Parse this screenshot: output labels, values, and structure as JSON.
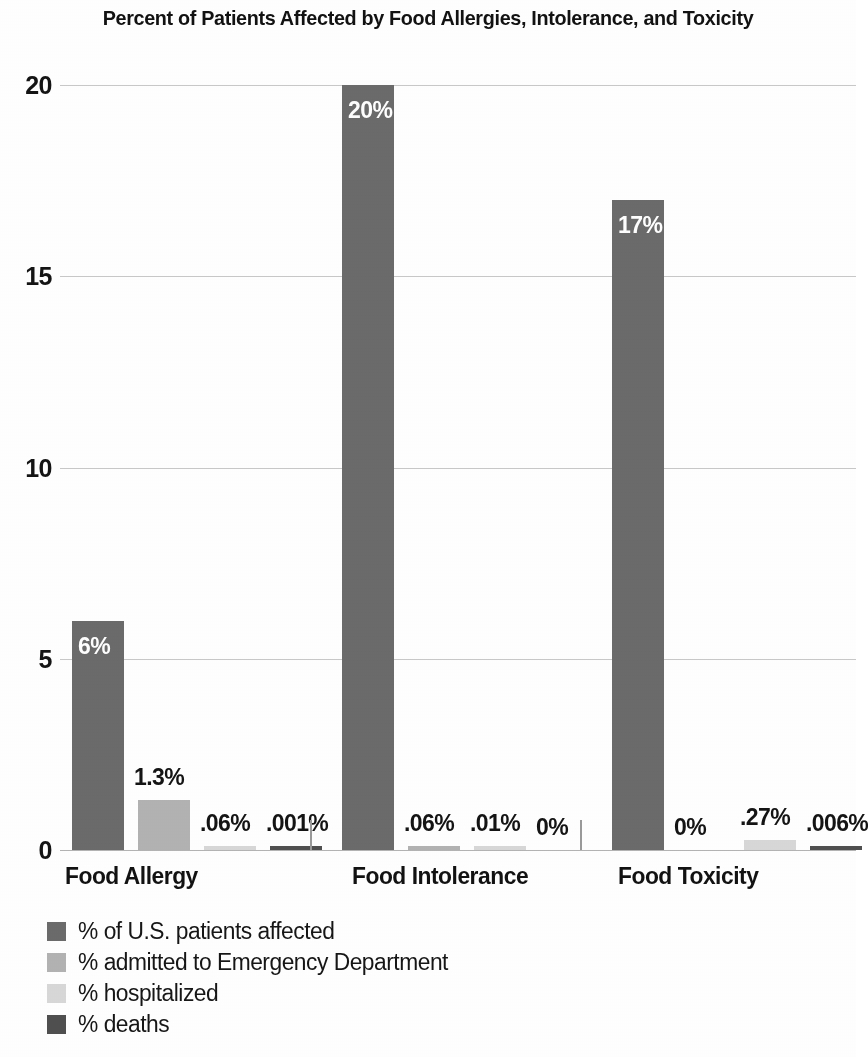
{
  "chart_data": {
    "type": "bar",
    "title": "Percent of Patients Affected by Food Allergies, Intolerance, and Toxicity",
    "xlabel": "",
    "ylabel": "",
    "ylim": [
      0,
      20
    ],
    "yticks": [
      0,
      5,
      10,
      15,
      20
    ],
    "ytick_labels": [
      "0",
      "5",
      "10",
      "15",
      "20"
    ],
    "grid": true,
    "legend_position": "bottom-left",
    "categories": [
      "Food Allergy",
      "Food Intolerance",
      "Food Toxicity"
    ],
    "series": [
      {
        "name": "% of U.S. patients affected",
        "color": "#6b6b6b",
        "values": [
          6,
          20,
          17
        ],
        "labels": [
          "6%",
          "20%",
          "17%"
        ]
      },
      {
        "name": "% admitted to Emergency Department",
        "color": "#b3b3b3",
        "values": [
          1.3,
          0.06,
          0
        ],
        "labels": [
          "1.3%",
          ".06%",
          "0%"
        ]
      },
      {
        "name": "% hospitalized",
        "color": "#d8d8d8",
        "values": [
          0.06,
          0.01,
          0.27
        ],
        "labels": [
          ".06%",
          ".01%",
          ".27%"
        ]
      },
      {
        "name": "% deaths",
        "color": "#4f4f4f",
        "values": [
          0.001,
          0,
          0.006
        ],
        "labels": [
          ".001%",
          "0%",
          ".006%"
        ]
      }
    ]
  },
  "axis": {
    "y_ticks": [
      {
        "value": "20"
      },
      {
        "value": "15"
      },
      {
        "value": "10"
      },
      {
        "value": "5"
      },
      {
        "value": "0"
      }
    ]
  },
  "categories": [
    {
      "label": "Food Allergy"
    },
    {
      "label": "Food Intolerance"
    },
    {
      "label": "Food Toxicity"
    }
  ],
  "legend": {
    "items": [
      {
        "label": "% of U.S. patients affected",
        "color": "#6b6b6b"
      },
      {
        "label": "% admitted to Emergency Department",
        "color": "#b3b3b3"
      },
      {
        "label": "% hospitalized",
        "color": "#d8d8d8"
      },
      {
        "label": "% deaths",
        "color": "#4f4f4f"
      }
    ]
  },
  "bar_labels": {
    "g0": [
      {
        "text": "6%",
        "inside": true
      },
      {
        "text": "1.3%",
        "inside": false
      },
      {
        "text": ".06%",
        "inside": false
      },
      {
        "text": ".001%",
        "inside": false
      }
    ],
    "g1": [
      {
        "text": "20%",
        "inside": true
      },
      {
        "text": ".06%",
        "inside": false
      },
      {
        "text": ".01%",
        "inside": false
      },
      {
        "text": "0%",
        "inside": false
      }
    ],
    "g2": [
      {
        "text": "17%",
        "inside": true
      },
      {
        "text": "0%",
        "inside": false
      },
      {
        "text": ".27%",
        "inside": false
      },
      {
        "text": ".006%",
        "inside": false
      }
    ]
  }
}
